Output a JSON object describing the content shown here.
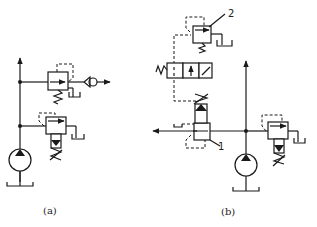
{
  "figure": {
    "subfigures": [
      {
        "id": "a",
        "caption": "(a)",
        "components": [
          "pump-icon",
          "relief-valve-adjustable-icon",
          "relief-valve-spring-icon",
          "check-valve-icon",
          "tank-icon"
        ]
      },
      {
        "id": "b",
        "caption": "(b)",
        "components": [
          "pump-icon",
          "pilot-relief-valve-1-icon",
          "remote-relief-valve-2-icon",
          "solenoid-directional-valve-icon",
          "relief-valve-adjustable-icon",
          "tank-icon"
        ],
        "callouts": [
          {
            "label": "1",
            "target": "pilot-relief-valve-1"
          },
          {
            "label": "2",
            "target": "remote-relief-valve-2"
          }
        ]
      }
    ]
  },
  "colors": {
    "line": "#1a1a1a",
    "background": "#ffffff"
  }
}
